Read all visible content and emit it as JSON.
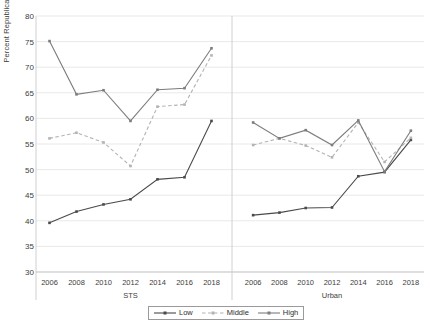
{
  "chart_data": {
    "type": "line",
    "title": "",
    "xlabel": "",
    "ylabel": "Percent Republican Identifiers",
    "ylim": [
      30,
      80
    ],
    "ytick_step": 5,
    "yticks": [
      30,
      35,
      40,
      45,
      50,
      55,
      60,
      65,
      70,
      75,
      80
    ],
    "grid": true,
    "legend_position": "bottom",
    "panels": [
      {
        "name": "STS",
        "categories": [
          2006,
          2008,
          2010,
          2012,
          2014,
          2016,
          2018
        ],
        "series": [
          {
            "name": "Low",
            "values": [
              39.6,
              41.8,
              43.2,
              44.2,
              48.1,
              48.5,
              59.5
            ]
          },
          {
            "name": "Middle",
            "values": [
              56.1,
              57.2,
              55.3,
              50.7,
              62.3,
              62.7,
              72.3
            ]
          },
          {
            "name": "High",
            "values": [
              75.1,
              64.7,
              65.5,
              59.5,
              65.6,
              65.9,
              73.7
            ]
          }
        ]
      },
      {
        "name": "Urban",
        "categories": [
          2006,
          2008,
          2010,
          2012,
          2014,
          2016,
          2018
        ],
        "series": [
          {
            "name": "Low",
            "values": [
              41.1,
              41.6,
              42.5,
              42.6,
              48.7,
              49.5,
              55.8
            ]
          },
          {
            "name": "Middle",
            "values": [
              54.8,
              56.1,
              54.7,
              52.4,
              59.2,
              51.5,
              56.2
            ]
          },
          {
            "name": "High",
            "values": [
              59.2,
              56.1,
              57.7,
              54.8,
              59.6,
              49.6,
              57.6
            ]
          }
        ]
      }
    ],
    "series_styles": [
      {
        "name": "Low",
        "color": "#4a4a4a",
        "dash": "none",
        "marker": "square"
      },
      {
        "name": "Middle",
        "color": "#b3b3b3",
        "dash": "dashed",
        "marker": "square"
      },
      {
        "name": "High",
        "color": "#7d7d7d",
        "dash": "none",
        "marker": "square"
      }
    ]
  },
  "legend": {
    "items": [
      {
        "label": "Low"
      },
      {
        "label": "Middle"
      },
      {
        "label": "High"
      }
    ]
  },
  "axis": {
    "y_title": "Percent Republican Identifiers"
  }
}
